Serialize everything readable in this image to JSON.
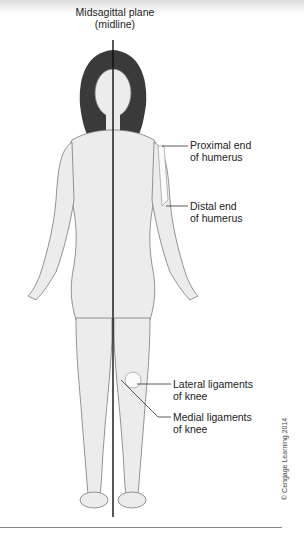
{
  "diagram": {
    "title_line1": "Midsagittal plane",
    "title_line2": "(midline)",
    "labels": [
      {
        "line1": "Proximal end",
        "line2": "of humerus"
      },
      {
        "line1": "Distal end",
        "line2": "of humerus"
      },
      {
        "line1": "Lateral ligaments",
        "line2": "of knee"
      },
      {
        "line1": "Medial ligaments",
        "line2": "of knee"
      }
    ],
    "copyright": "© Cengage Learning 2014",
    "colors": {
      "line": "#111111",
      "skin": "#ececec",
      "outline": "#7a7a7a",
      "hair": "#3a3a3a",
      "bone": "#fafafa"
    }
  }
}
